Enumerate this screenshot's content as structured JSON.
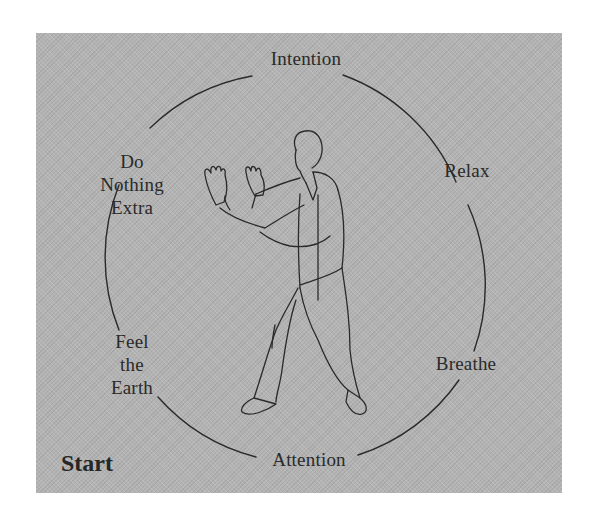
{
  "diagram": {
    "type": "cycle",
    "background_color": "#b3b3b3",
    "line_color": "#2a2a2a",
    "start_label": "Start",
    "center_figure": "tai-chi-practitioner",
    "nodes": [
      {
        "id": "intention",
        "lines": [
          "Intention"
        ]
      },
      {
        "id": "relax",
        "lines": [
          "Relax"
        ]
      },
      {
        "id": "breathe",
        "lines": [
          "Breathe"
        ]
      },
      {
        "id": "attention",
        "lines": [
          "Attention"
        ]
      },
      {
        "id": "feel-the-earth",
        "lines": [
          "Feel",
          "the",
          "Earth"
        ]
      },
      {
        "id": "do-nothing-extra",
        "lines": [
          "Do",
          "Nothing",
          "Extra"
        ]
      }
    ]
  }
}
